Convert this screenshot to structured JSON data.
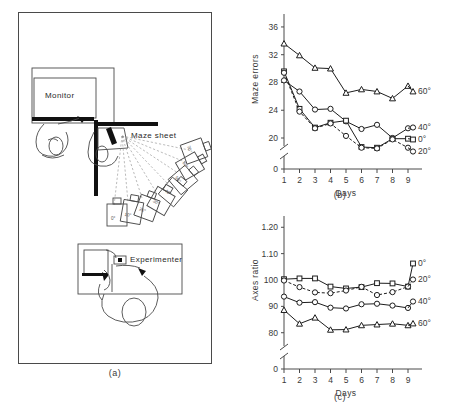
{
  "figure": {
    "panel_a": {
      "caption": "(a)",
      "labels": {
        "monitor": "Monitor",
        "maze_sheet": "Maze sheet",
        "experimenter": "Experimenter"
      },
      "card_angles": [
        "0°",
        "10°",
        "20°",
        "30°",
        "40°",
        "50°",
        "60°",
        "70°"
      ]
    },
    "panel_b": {
      "caption": "(b)"
    },
    "panel_c": {
      "caption": "(c)"
    }
  },
  "chart_data": [
    {
      "type": "line",
      "panel": "b",
      "title": "",
      "xlabel": "Days",
      "ylabel": "Maze errors",
      "x": [
        1,
        2,
        3,
        4,
        5,
        6,
        7,
        8,
        9
      ],
      "xticklabels": [
        "1",
        "2",
        "3",
        "4",
        "5",
        "6",
        "7",
        "8",
        "9"
      ],
      "yticklabels": [
        "0",
        "20",
        "24",
        "28",
        "32",
        "36"
      ],
      "ytickvalues": [
        0,
        20,
        24,
        28,
        32,
        36
      ],
      "ylim": [
        20,
        37
      ],
      "axis_break": true,
      "grid": false,
      "legend_position": "right-inline",
      "series": [
        {
          "name": "60°",
          "marker": "triangle",
          "linestyle": "solid",
          "values": [
            33.6,
            31.9,
            30.1,
            30.0,
            26.5,
            27.0,
            26.7,
            25.7,
            27.5
          ]
        },
        {
          "name": "40°",
          "marker": "circle",
          "linestyle": "solid",
          "values": [
            28.3,
            26.7,
            24.1,
            24.2,
            22.4,
            21.3,
            21.9,
            20.0,
            21.4
          ]
        },
        {
          "name": "0°",
          "marker": "square",
          "linestyle": "solid",
          "values": [
            29.6,
            24.2,
            21.5,
            22.2,
            22.5,
            18.7,
            18.6,
            19.9,
            19.9
          ]
        },
        {
          "name": "20°",
          "marker": "circle",
          "linestyle": "dashed",
          "values": [
            29.4,
            23.8,
            21.4,
            22.1,
            20.3,
            18.6,
            18.5,
            19.8,
            18.6
          ]
        }
      ]
    },
    {
      "type": "line",
      "panel": "c",
      "title": "",
      "xlabel": "Days",
      "ylabel": "Axes ratio",
      "x": [
        1,
        2,
        3,
        4,
        5,
        6,
        7,
        8,
        9
      ],
      "xticklabels": [
        "1",
        "2",
        "3",
        "4",
        "5",
        "6",
        "7",
        "8",
        "9"
      ],
      "yticklabels": [
        "0",
        "80",
        "90",
        "100",
        "1.10",
        "1.20"
      ],
      "ytickvalues": [
        0,
        80,
        90,
        100,
        110,
        120
      ],
      "ylim": [
        78,
        122
      ],
      "axis_break": true,
      "grid": false,
      "legend_position": "right-inline",
      "series": [
        {
          "name": "0°",
          "marker": "square",
          "linestyle": "solid",
          "values": [
            100.3,
            100.6,
            100.6,
            97.5,
            96.8,
            97.3,
            98.8,
            98.7,
            97.5
          ]
        },
        {
          "name": "20°",
          "marker": "circle",
          "linestyle": "dashed",
          "values": [
            99.8,
            97.3,
            95.3,
            95.0,
            96.0,
            97.4,
            94.3,
            95.4,
            97.5
          ]
        },
        {
          "name": "40°",
          "marker": "circle",
          "linestyle": "solid",
          "values": [
            93.7,
            91.4,
            91.6,
            89.5,
            89.2,
            90.8,
            91.0,
            90.3,
            89.4
          ]
        },
        {
          "name": "60°",
          "marker": "triangle",
          "linestyle": "solid",
          "values": [
            88.6,
            83.4,
            85.7,
            81.1,
            81.2,
            82.8,
            83.1,
            83.4,
            82.8
          ]
        }
      ]
    }
  ]
}
